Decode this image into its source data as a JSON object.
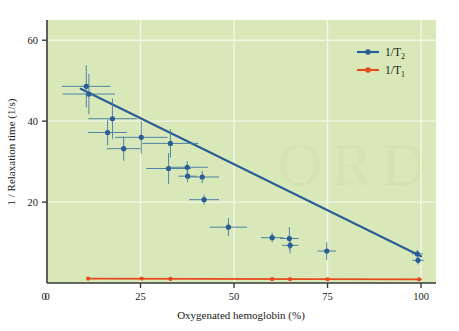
{
  "chart_data": {
    "type": "scatter",
    "title": "",
    "xlabel": "Oxygenated hemoglobin (%)",
    "ylabel": "1 / Relaxation time (1/s)",
    "xlim": [
      0,
      104
    ],
    "ylim": [
      0,
      65
    ],
    "xticks": [
      0,
      25,
      50,
      75,
      100
    ],
    "xticklabels": [
      "0",
      "25",
      "50",
      "75",
      "100"
    ],
    "yticks": [
      0,
      20,
      40,
      60
    ],
    "yticklabels": [
      "0",
      "20",
      "40",
      "60"
    ],
    "grid": true,
    "grid_color": "#f2f7ea",
    "plot_background": "#d8e8b8",
    "legend_position": "top-right",
    "series": [
      {
        "name": "1/T2",
        "label_main": "1/T",
        "label_sub": "2",
        "color": "#2a5d96",
        "marker": "circle",
        "has_fit_line": true,
        "fit_line": {
          "x0": 9.0,
          "y0": 48.0,
          "x1": 100.0,
          "y1": 6.6
        },
        "points": [
          {
            "x": 10.5,
            "y": 48.6,
            "xerr": 6.5,
            "yerr": 5.2
          },
          {
            "x": 11.2,
            "y": 46.7,
            "xerr": 7.0,
            "yerr": 5.0
          },
          {
            "x": 17.5,
            "y": 40.6,
            "xerr": 6.5,
            "yerr": 5.0
          },
          {
            "x": 16.2,
            "y": 37.2,
            "xerr": 5.2,
            "yerr": 3.2
          },
          {
            "x": 20.5,
            "y": 33.2,
            "xerr": 4.5,
            "yerr": 3.0
          },
          {
            "x": 25.2,
            "y": 36.0,
            "xerr": 7.0,
            "yerr": 4.0
          },
          {
            "x": 33.0,
            "y": 34.5,
            "xerr": 7.5,
            "yerr": 3.5
          },
          {
            "x": 32.5,
            "y": 28.3,
            "xerr": 6.0,
            "yerr": 3.8
          },
          {
            "x": 37.5,
            "y": 28.6,
            "xerr": 5.5,
            "yerr": 1.5
          },
          {
            "x": 37.6,
            "y": 26.4,
            "xerr": 2.5,
            "yerr": 1.5
          },
          {
            "x": 41.5,
            "y": 26.2,
            "xerr": 4.5,
            "yerr": 1.5
          },
          {
            "x": 42.0,
            "y": 20.6,
            "xerr": 4.0,
            "yerr": 1.2
          },
          {
            "x": 48.5,
            "y": 13.8,
            "xerr": 5.0,
            "yerr": 2.2
          },
          {
            "x": 60.2,
            "y": 11.2,
            "xerr": 3.0,
            "yerr": 1.2
          },
          {
            "x": 64.8,
            "y": 11.0,
            "xerr": 2.5,
            "yerr": 2.8
          },
          {
            "x": 65.0,
            "y": 9.3,
            "xerr": 2.2,
            "yerr": 2.0
          },
          {
            "x": 74.8,
            "y": 7.9,
            "xerr": 2.5,
            "yerr": 2.2
          },
          {
            "x": 99.0,
            "y": 7.2,
            "xerr": 1.5,
            "yerr": 1.0
          },
          {
            "x": 99.2,
            "y": 5.6,
            "xerr": 1.5,
            "yerr": 1.0
          }
        ]
      },
      {
        "name": "1/T1",
        "label_main": "1/T",
        "label_sub": "1",
        "color": "#e8491e",
        "marker": "circle",
        "has_fit_line": true,
        "fit_line": {
          "x0": 11.0,
          "y0": 1.1,
          "x1": 100.0,
          "y1": 0.9
        },
        "points": [
          {
            "x": 11.0,
            "y": 1.1
          },
          {
            "x": 25.3,
            "y": 1.1
          },
          {
            "x": 33.0,
            "y": 1.0
          },
          {
            "x": 60.2,
            "y": 0.95
          },
          {
            "x": 65.0,
            "y": 0.95
          },
          {
            "x": 75.0,
            "y": 0.9
          },
          {
            "x": 99.5,
            "y": 0.9
          }
        ]
      }
    ]
  }
}
